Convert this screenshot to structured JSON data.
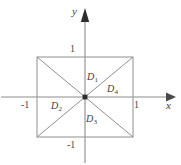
{
  "figure": {
    "type": "coordinate-diagram",
    "axes": {
      "x_label": "x",
      "y_label": "y",
      "x_axis_color": "#8c8c8c",
      "y_axis_color": "#8c8c8c"
    },
    "ticks": {
      "x_positive": "1",
      "x_negative": "-1",
      "y_positive": "1",
      "y_negative": "-1"
    },
    "regions": [
      {
        "id": "D1",
        "base": "D",
        "sub": "1",
        "location": "top"
      },
      {
        "id": "D2",
        "base": "D",
        "sub": "2",
        "location": "left"
      },
      {
        "id": "D3",
        "base": "D",
        "sub": "3",
        "location": "bottom"
      },
      {
        "id": "D4",
        "base": "D",
        "sub": "4",
        "location": "right"
      }
    ],
    "colors": {
      "square_stroke": "#9a9a9a",
      "diagonal_stroke": "#8f8f8f",
      "axis_stroke": "#8c8c8c",
      "origin_dot": "#2b2b2b",
      "text": "#3d3d3d",
      "background": "#ffffff"
    },
    "geometry": {
      "origin_x": 85,
      "origin_y": 97,
      "square_left": 37,
      "square_right": 133,
      "square_top": 57,
      "square_bottom": 137
    }
  }
}
